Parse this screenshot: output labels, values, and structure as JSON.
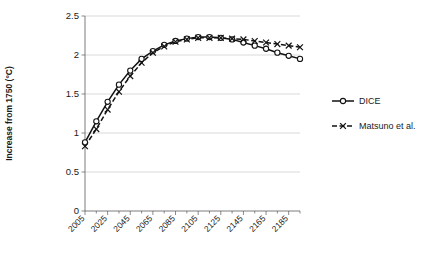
{
  "chart_data": {
    "type": "line",
    "title": "",
    "xlabel": "",
    "ylabel": "Increase from 1750 (°C)",
    "xlim": [
      2005,
      2195
    ],
    "ylim": [
      0,
      2.5
    ],
    "ytick_labels": [
      "0",
      "0.5",
      "1",
      "1.5",
      "2",
      "2.5"
    ],
    "ytick_values": [
      0,
      0.5,
      1,
      1.5,
      2,
      2.5
    ],
    "xtick_labels": [
      "2005",
      "2025",
      "2045",
      "2065",
      "2085",
      "2105",
      "2125",
      "2145",
      "2165",
      "2185"
    ],
    "xtick_values": [
      2005,
      2025,
      2045,
      2065,
      2085,
      2105,
      2125,
      2145,
      2165,
      2185
    ],
    "x": [
      2005,
      2015,
      2025,
      2035,
      2045,
      2055,
      2065,
      2075,
      2085,
      2095,
      2105,
      2115,
      2125,
      2135,
      2145,
      2155,
      2165,
      2175,
      2185,
      2195
    ],
    "grid": true,
    "legend_position": "right",
    "series": [
      {
        "name": "DICE",
        "marker": "circle",
        "linestyle": "solid",
        "color": "#121212",
        "values": [
          0.88,
          1.15,
          1.4,
          1.62,
          1.8,
          1.95,
          2.05,
          2.13,
          2.18,
          2.21,
          2.23,
          2.23,
          2.22,
          2.2,
          2.16,
          2.12,
          2.08,
          2.03,
          1.99,
          1.95
        ]
      },
      {
        "name": "Matsuno et al.",
        "marker": "cross",
        "linestyle": "dashed",
        "color": "#121212",
        "values": [
          0.83,
          1.05,
          1.3,
          1.53,
          1.73,
          1.9,
          2.03,
          2.11,
          2.17,
          2.2,
          2.22,
          2.22,
          2.22,
          2.21,
          2.2,
          2.18,
          2.16,
          2.14,
          2.12,
          2.1
        ]
      }
    ]
  },
  "legend": {
    "items": [
      {
        "label": "DICE"
      },
      {
        "label": "Matsuno et al."
      }
    ]
  }
}
